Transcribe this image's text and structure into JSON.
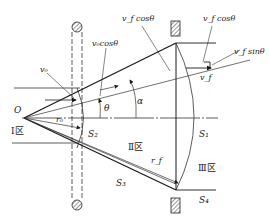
{
  "labels": {
    "origin": "O",
    "v0": "v₀",
    "v0cos": "v₀cosθ",
    "vfcos_top": "v_f cosθ",
    "vfcos_right": "v_f cosθ",
    "vfsin": "v_f sinθ",
    "vf": "v_f",
    "theta": "θ",
    "alpha": "α",
    "r0": "r₀",
    "rf": "r_f",
    "S1": "S₁",
    "S2": "S₂",
    "S3": "S₃",
    "S4": "S₄"
  },
  "zones": {
    "zone1": "Ⅰ区",
    "zone2": "Ⅱ区",
    "zone3": "Ⅲ区"
  },
  "colors": {
    "line": "#1a1a1a",
    "background": "#ffffff"
  }
}
